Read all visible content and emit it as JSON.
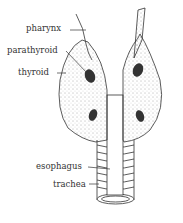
{
  "diagram": {
    "labels": {
      "pharynx": "pharynx",
      "parathyroid": "parathyroid",
      "thyroid": "thyroid",
      "esophagus": "esophagus",
      "trachea": "trachea"
    },
    "colors": {
      "ink": "#333333",
      "background": "#ffffff"
    }
  }
}
